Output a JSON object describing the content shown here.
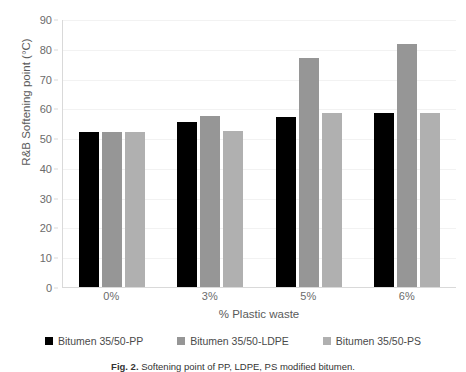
{
  "chart_data": {
    "type": "bar",
    "title": "",
    "xlabel": "% Plastic waste",
    "ylabel": "R&B Softening point (°C)",
    "categories": [
      "0%",
      "3%",
      "5%",
      "6%"
    ],
    "ylim": [
      0,
      90
    ],
    "yticks": [
      0,
      10,
      20,
      30,
      40,
      50,
      60,
      70,
      80,
      90
    ],
    "grid": true,
    "legend_position": "bottom",
    "series": [
      {
        "name": "Bitumen 35/50-PP",
        "color": "#000000",
        "values": [
          52,
          55.5,
          57,
          58.5
        ]
      },
      {
        "name": "Bitumen 35/50-LDPE",
        "color": "#969696",
        "values": [
          52,
          57.5,
          77,
          81.5
        ]
      },
      {
        "name": "Bitumen 35/50-PS",
        "color": "#b0b0b0",
        "values": [
          52,
          52.5,
          58.5,
          58.5
        ]
      }
    ]
  },
  "caption": {
    "prefix": "Fig. 2.",
    "text": "Softening point of PP, LDPE, PS modified bitumen."
  }
}
